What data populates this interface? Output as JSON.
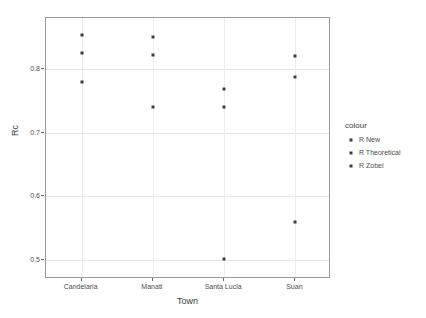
{
  "chart_data": {
    "type": "scatter",
    "title": "",
    "xlabel": "Town",
    "ylabel": "Rc",
    "categories": [
      "Candelaria",
      "Manati",
      "Santa Lucia",
      "Suan"
    ],
    "yticks": [
      "0.5",
      "0.6",
      "0.7",
      "0.8"
    ],
    "ytick_values": [
      0.5,
      0.6,
      0.7,
      0.8
    ],
    "ylim": [
      0.47,
      0.88
    ],
    "grid": true,
    "legend_position": "right",
    "legend": {
      "title": "colour",
      "entries": [
        "R New",
        "R Theoretical",
        "R Zobel"
      ]
    },
    "series": [
      {
        "name": "R New",
        "points": [
          {
            "category": "Candelaria",
            "value": 0.78
          },
          {
            "category": "Manati",
            "value": 0.74
          },
          {
            "category": "Santa Lucia",
            "value": 0.74
          },
          {
            "category": "Suan",
            "value": 0.56
          }
        ]
      },
      {
        "name": "R Theoretical",
        "points": [
          {
            "category": "Candelaria",
            "value": 0.825
          },
          {
            "category": "Manati",
            "value": 0.822
          },
          {
            "category": "Santa Lucia",
            "value": 0.768
          },
          {
            "category": "Suan",
            "value": 0.787
          }
        ]
      },
      {
        "name": "R Zobel",
        "points": [
          {
            "category": "Candelaria",
            "value": 0.853
          },
          {
            "category": "Manati",
            "value": 0.85
          },
          {
            "category": "Santa Lucia",
            "value": 0.501
          },
          {
            "category": "Suan",
            "value": 0.82
          }
        ]
      }
    ],
    "colors": {
      "point": "#3d3d3d",
      "panel_border": "#9a9a9a",
      "gridline": "#e6e6e6",
      "background": "#ffffff",
      "text": "#4d4d4d"
    }
  }
}
